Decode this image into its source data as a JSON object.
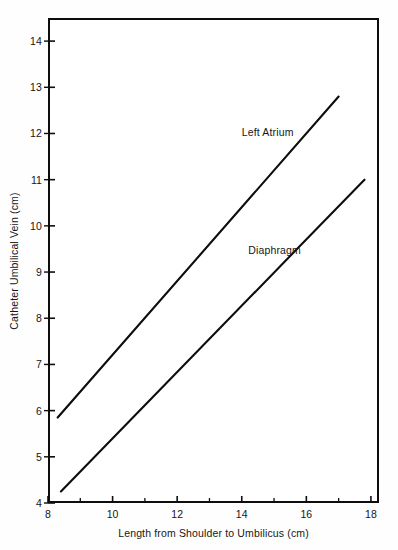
{
  "chart_data": {
    "type": "line",
    "title": "",
    "xlabel": "Length from Shoulder to Umbilicus (cm)",
    "ylabel": "Catheter Umbilical Vein (cm)",
    "xlim": [
      8,
      18.25
    ],
    "ylim": [
      4,
      14.5
    ],
    "grid": false,
    "legend_position": "inline-annotations",
    "x_ticks": [
      8,
      9,
      10,
      11,
      12,
      13,
      14,
      15,
      16,
      17,
      18
    ],
    "x_tick_labels": [
      "8",
      "",
      "10",
      "",
      "12",
      "",
      "14",
      "",
      "16",
      "",
      "18"
    ],
    "x_tick_labels_shown": [
      "8",
      "10",
      "12",
      "14",
      "16",
      "18"
    ],
    "y_ticks": [
      4,
      5,
      6,
      7,
      8,
      9,
      10,
      11,
      12,
      13,
      14
    ],
    "y_tick_labels": [
      "4",
      "5",
      "6",
      "7",
      "8",
      "9",
      "10",
      "11",
      "12",
      "13",
      "14"
    ],
    "series": [
      {
        "name": "Left Atrium",
        "label": "Left Atrium",
        "label_x": 14.0,
        "label_y": 12.0,
        "color": "#0d0d0d",
        "x": [
          8.3,
          17.0
        ],
        "values": [
          5.85,
          12.8
        ],
        "points": [
          [
            8.3,
            5.85
          ],
          [
            17.0,
            12.8
          ]
        ]
      },
      {
        "name": "Diaphragm",
        "label": "Diaphragm",
        "label_x": 14.2,
        "label_y": 9.45,
        "color": "#0d0d0d",
        "x": [
          8.4,
          17.8
        ],
        "values": [
          4.25,
          11.0
        ],
        "points": [
          [
            8.4,
            4.25
          ],
          [
            17.8,
            11.0
          ]
        ]
      }
    ]
  }
}
